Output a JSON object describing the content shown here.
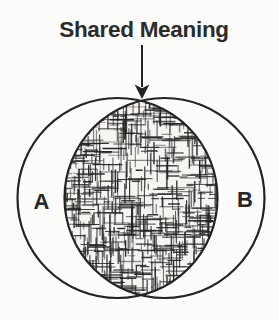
{
  "diagram": {
    "title": "Shared Meaning",
    "left_circle_label": "A",
    "right_circle_label": "B",
    "intersection_style": "dense irregular crosshatch shading",
    "annotation": {
      "arrow_icon": "down-arrow",
      "points_to": "intersection of circles A and B"
    },
    "colors": {
      "ink": "#232323",
      "paper": "#fcfcfb",
      "title_text": "#2b2b2b"
    }
  }
}
